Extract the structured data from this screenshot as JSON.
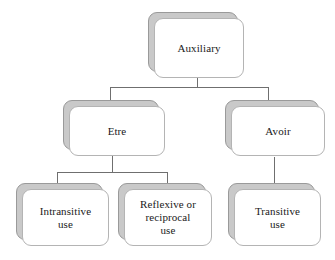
{
  "diagram": {
    "type": "hierarchy-tree",
    "background_color": "#ffffff",
    "node_fill_color": "#ffffff",
    "node_border_color": "#b4b4b4",
    "node_shadow_color": "#c9c9c9",
    "connector_color": "#6f6f6f",
    "text_color": "#1a1a1a",
    "nodes": [
      {
        "id": "auxiliary",
        "label": "Auxiliary",
        "level": 0
      },
      {
        "id": "etre",
        "label": "Etre",
        "level": 1,
        "parent": "auxiliary"
      },
      {
        "id": "avoir",
        "label": "Avoir",
        "level": 1,
        "parent": "auxiliary"
      },
      {
        "id": "intransitive-use",
        "label": "Intransitive\nuse",
        "level": 2,
        "parent": "etre"
      },
      {
        "id": "reflexive-or-reciprocal-use",
        "label": "Reflexive or\nreciprocal\nuse",
        "level": 2,
        "parent": "etre"
      },
      {
        "id": "transitive-use",
        "label": "Transitive\nuse",
        "level": 2,
        "parent": "avoir"
      }
    ]
  }
}
